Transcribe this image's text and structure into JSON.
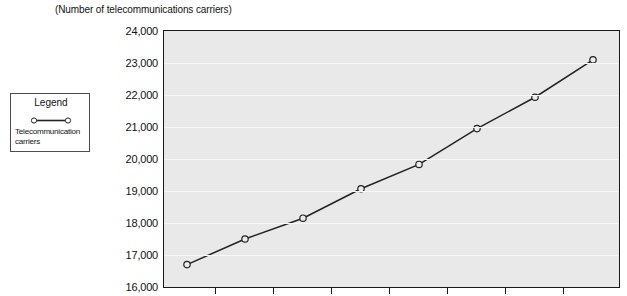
{
  "chart_data": {
    "type": "line",
    "title": "(Number of telecommunications carriers)",
    "xlabel": "",
    "ylabel": "",
    "ylim": [
      16000,
      24000
    ],
    "ytick_step": 1000,
    "yticks": [
      "24,000",
      "23,000",
      "22,000",
      "21,000",
      "20,000",
      "19,000",
      "18,000",
      "17,000",
      "16,000"
    ],
    "ytick_values": [
      24000,
      23000,
      22000,
      21000,
      20000,
      19000,
      18000,
      17000,
      16000
    ],
    "grid": "horizontal",
    "legend_position": "left-outside",
    "x": [
      1,
      2,
      3,
      4,
      5,
      6,
      7,
      8
    ],
    "xtick_count": 7,
    "xticklabels": [
      "",
      "",
      "",
      "",
      "",
      "",
      ""
    ],
    "series": [
      {
        "name": "Telecommunication carriers",
        "marker": "open-circle",
        "color": "#222222",
        "values": [
          16700,
          17500,
          18150,
          19070,
          19830,
          20950,
          21930,
          23100
        ]
      }
    ]
  },
  "legend": {
    "title": "Legend",
    "entries": [
      {
        "label": "Telecommunication carriers",
        "marker": "open-circle-line",
        "color": "#222222"
      }
    ]
  },
  "colors": {
    "plot_background": "#e9e9e9",
    "gridline": "#f8f8f8",
    "axis": "#1a1a1a",
    "series": "#222222",
    "page_background": "#ffffff"
  }
}
